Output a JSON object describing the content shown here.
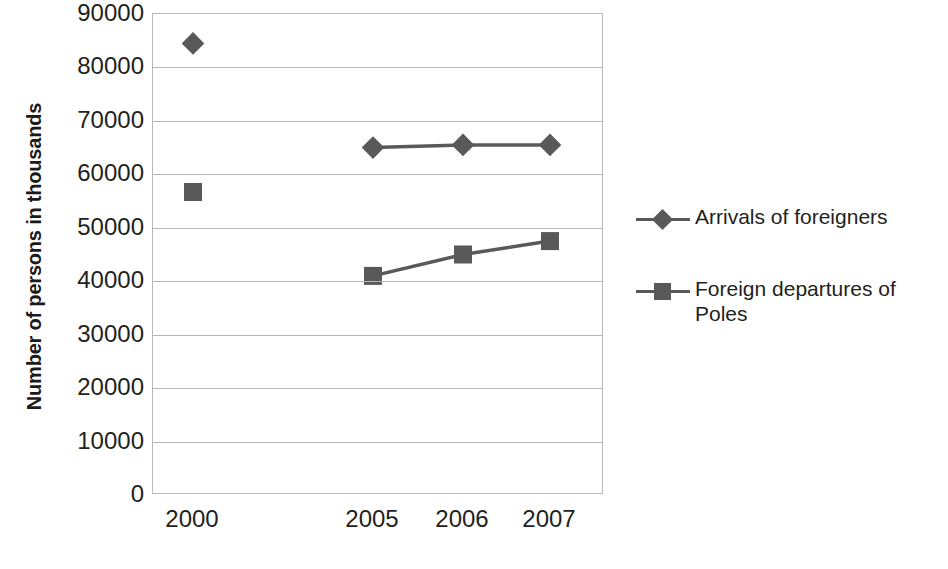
{
  "chart_data": {
    "type": "line",
    "title": "",
    "xlabel": "",
    "ylabel": "Number of persons in thousands",
    "categories": [
      "2000",
      "2005",
      "2006",
      "2007"
    ],
    "ylim": [
      0,
      90000
    ],
    "ytick_step": 10000,
    "yticks": [
      "90000",
      "80000",
      "70000",
      "60000",
      "50000",
      "40000",
      "30000",
      "20000",
      "10000",
      "0"
    ],
    "ytick_values": [
      90000,
      80000,
      70000,
      60000,
      50000,
      40000,
      30000,
      20000,
      10000,
      0
    ],
    "grid": true,
    "grid_axis": "y",
    "legend_position": "right",
    "series": [
      {
        "name": "Arrivals of foreigners",
        "marker": "diamond",
        "color": "#595959",
        "values": [
          84500,
          65000,
          65500,
          65500
        ],
        "connected_from": "2005"
      },
      {
        "name": "Foreign departures of Poles",
        "marker": "square",
        "color": "#595959",
        "values": [
          56700,
          41000,
          45000,
          47500
        ],
        "connected_from": "2005"
      }
    ]
  },
  "legend": {
    "items": [
      {
        "label": "Arrivals of foreigners",
        "marker": "diamond-marker-icon"
      },
      {
        "label": "Foreign departures of Poles",
        "marker": "square-marker-icon"
      }
    ]
  },
  "colors": {
    "series": "#595959",
    "gridline": "#b5b5b5",
    "axis": "#b9b9b9",
    "text": "#231f20"
  }
}
